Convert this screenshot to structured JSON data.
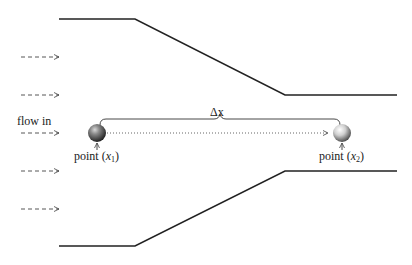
{
  "diagram": {
    "flow_label": "flow in",
    "delta_label": "Δx",
    "points": [
      {
        "label_prefix": "point (",
        "var": "x",
        "sub": "1",
        "label_suffix": ")",
        "x": 97,
        "y": 133
      },
      {
        "label_prefix": "point (",
        "var": "x",
        "sub": "2",
        "label_suffix": ")",
        "x": 342,
        "y": 133
      }
    ],
    "walls": {
      "top": [
        [
          59,
          19
        ],
        [
          135,
          19
        ],
        [
          285,
          95
        ],
        [
          397,
          95
        ]
      ],
      "bottom": [
        [
          59,
          246
        ],
        [
          135,
          246
        ],
        [
          285,
          171
        ],
        [
          397,
          171
        ]
      ]
    },
    "inflow_arrows_y": [
      57,
      95,
      133,
      171,
      209
    ],
    "colors": {
      "wall": "#222222",
      "arrow": "#444444",
      "sphere_dark": "#2a2a2a",
      "sphere_light": "#f2f2f2",
      "text": "#222222"
    }
  }
}
